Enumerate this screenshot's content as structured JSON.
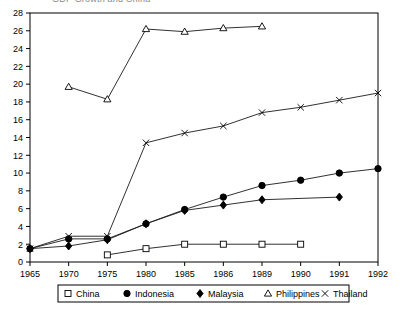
{
  "figure": {
    "clipped_top_text": "GDP Growth and China",
    "background_color": "#ffffff",
    "line_color": "#1a1a1a"
  },
  "chart_data": {
    "type": "line",
    "title": "",
    "xlabel": "",
    "ylabel": "",
    "categories": [
      "1965",
      "1970",
      "1975",
      "1980",
      "1985",
      "1986",
      "1989",
      "1990",
      "1991",
      "1992"
    ],
    "ylim": [
      0,
      28
    ],
    "ytick_step": 2,
    "yticks": [
      0,
      2,
      4,
      6,
      8,
      10,
      12,
      14,
      16,
      18,
      20,
      22,
      24,
      26,
      28
    ],
    "grid": false,
    "legend_position": "bottom",
    "series": [
      {
        "name": "China",
        "marker": "open-square",
        "x": [
          "1975",
          "1980",
          "1985",
          "1986",
          "1989",
          "1990"
        ],
        "values": [
          0.8,
          1.5,
          2.0,
          2.0,
          2.0,
          2.0
        ]
      },
      {
        "name": "Indonesia",
        "marker": "filled-circle",
        "x": [
          "1965",
          "1970",
          "1975",
          "1980",
          "1985",
          "1986",
          "1989",
          "1990",
          "1991",
          "1992"
        ],
        "values": [
          1.5,
          2.6,
          2.6,
          4.3,
          5.9,
          7.3,
          8.6,
          9.2,
          10.0,
          10.5
        ]
      },
      {
        "name": "Malaysia",
        "marker": "filled-diamond",
        "x": [
          "1965",
          "1970",
          "1975",
          "1980",
          "1985",
          "1986",
          "1989",
          "1991"
        ],
        "values": [
          1.5,
          1.8,
          2.5,
          4.3,
          5.8,
          6.4,
          7.0,
          7.3
        ]
      },
      {
        "name": "Philippines",
        "marker": "open-triangle",
        "x": [
          "1970",
          "1975",
          "1980",
          "1985",
          "1986",
          "1989"
        ],
        "values": [
          19.7,
          18.3,
          26.2,
          25.9,
          26.3,
          26.5
        ]
      },
      {
        "name": "Thailand",
        "marker": "cross",
        "x": [
          "1965",
          "1970",
          "1975",
          "1980",
          "1985",
          "1986",
          "1989",
          "1990",
          "1991",
          "1992"
        ],
        "values": [
          1.5,
          2.9,
          2.9,
          13.4,
          14.5,
          15.3,
          16.8,
          17.4,
          18.2,
          19.0
        ]
      }
    ]
  },
  "legend": {
    "items": [
      {
        "label": "China",
        "marker": "open-square"
      },
      {
        "label": "Indonesia",
        "marker": "filled-circle"
      },
      {
        "label": "Malaysia",
        "marker": "filled-diamond"
      },
      {
        "label": "Philippines",
        "marker": "open-triangle"
      },
      {
        "label": "Thailand",
        "marker": "cross"
      }
    ]
  }
}
